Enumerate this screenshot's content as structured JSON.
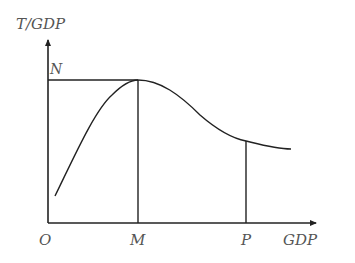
{
  "diagram": {
    "y_axis_label": "T/GDP",
    "x_axis_label": "GDP",
    "origin_label": "O",
    "peak_level_label": "N",
    "x_points": [
      {
        "label": "M",
        "description": "GDP level at peak T/GDP"
      },
      {
        "label": "P",
        "description": "GDP level on declining segment"
      }
    ],
    "line_color": "#222222",
    "label_color": "#555555"
  }
}
